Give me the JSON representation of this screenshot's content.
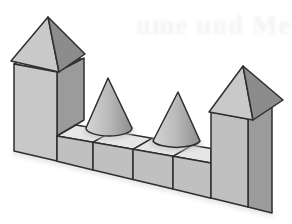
{
  "page": {
    "background": "#ffffff"
  },
  "bleed_through": {
    "text": "ume und Me"
  },
  "figure": {
    "name": "block-castle",
    "solids": {
      "left_tower": "square prism with pyramid roof",
      "right_tower": "square prism with pyramid roof",
      "wall": "row of four cubes",
      "cones": "two cones standing on the wall"
    }
  },
  "colors": {
    "background": "#ffffff",
    "outline": "#2e2e2e",
    "face_top": "#e6e6e6",
    "face_front_light": "#c8c8c8",
    "face_front": "#c0c0c0",
    "face_side_dark": "#9b9b9b",
    "pyramid_light": "#c9c9c9",
    "pyramid_dark": "#8c8c8c",
    "cone_light": "#d6d6d6",
    "cone_mid": "#b9b9b9",
    "cone_dark": "#8e8e8e",
    "contact_shadow": "#c6c6c6",
    "scan_shadow": "#c9c9c9",
    "bleed_text": "#f3f3f3"
  }
}
